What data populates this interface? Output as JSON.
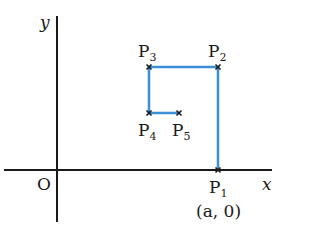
{
  "axes": {
    "x_label": "x",
    "y_label": "y",
    "origin_label": "O"
  },
  "points": [
    {
      "name": "P",
      "sub": "1",
      "coord": "(a, 0)"
    },
    {
      "name": "P",
      "sub": "2"
    },
    {
      "name": "P",
      "sub": "3"
    },
    {
      "name": "P",
      "sub": "4"
    },
    {
      "name": "P",
      "sub": "5"
    }
  ],
  "colors": {
    "path": "#3a8fd8",
    "axis": "#1a1a1a"
  }
}
